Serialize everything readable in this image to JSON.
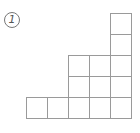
{
  "figure": {
    "label": "1",
    "grid": {
      "cell_size": 21,
      "origin_x": 26,
      "origin_y": 13,
      "line_color": "#9a9a9a",
      "columns": [
        {
          "col": 0,
          "rows": [
            4
          ]
        },
        {
          "col": 1,
          "rows": [
            4
          ]
        },
        {
          "col": 2,
          "rows": [
            2,
            3,
            4
          ]
        },
        {
          "col": 3,
          "rows": [
            2,
            3,
            4
          ]
        },
        {
          "col": 4,
          "rows": [
            0,
            1,
            2,
            3,
            4
          ]
        }
      ],
      "column_heights": [
        1,
        1,
        3,
        3,
        5
      ]
    }
  }
}
